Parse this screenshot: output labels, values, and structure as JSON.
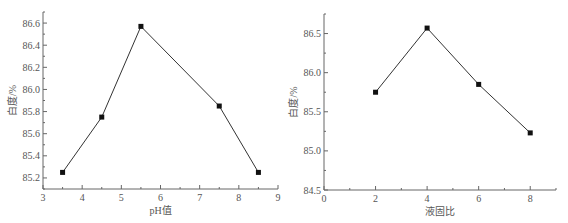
{
  "chart_data": [
    {
      "type": "line",
      "title": "",
      "xlabel": "pH值",
      "ylabel": "白度/%",
      "x": [
        3.5,
        4.5,
        5.5,
        7.5,
        8.5
      ],
      "series": [
        {
          "name": "白度",
          "values": [
            85.25,
            85.75,
            86.57,
            85.85,
            85.25
          ]
        }
      ],
      "xlim": [
        3,
        9
      ],
      "ylim": [
        85.1,
        86.7
      ],
      "xticks": [
        "3",
        "4",
        "5",
        "6",
        "7",
        "8",
        "9"
      ],
      "yticks": [
        "85.2",
        "85.4",
        "85.6",
        "85.8",
        "86.0",
        "86.2",
        "86.4",
        "86.6"
      ],
      "grid": false,
      "marker": "square"
    },
    {
      "type": "line",
      "title": "",
      "xlabel": "液固比",
      "ylabel": "白度/%",
      "x": [
        2,
        4,
        6,
        8
      ],
      "series": [
        {
          "name": "白度",
          "values": [
            85.75,
            86.57,
            85.85,
            85.23
          ]
        }
      ],
      "xlim": [
        0,
        9
      ],
      "ylim": [
        84.5,
        86.75
      ],
      "xticks": [
        "0",
        "2",
        "4",
        "6",
        "8"
      ],
      "yticks": [
        "84.5",
        "85.0",
        "85.5",
        "86.0",
        "86.5"
      ],
      "grid": false,
      "marker": "square"
    }
  ]
}
